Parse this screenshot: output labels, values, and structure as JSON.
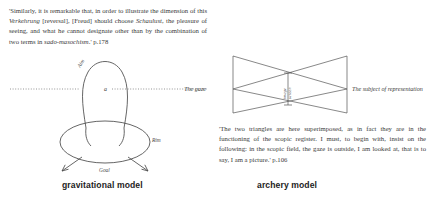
{
  "page": {
    "background_color": "#ffffff",
    "ink_color": "#4a4a4a",
    "text_color": "#3a3a3a"
  },
  "quotes": {
    "freud": "'Similarly, it is remarkable that, in order to illustrate the dimension of this Verkehrung [reversal], [Freud] should choose Schaulust, the pleasure of seeing, and what he cannot designate other than by the combination of two terms in sado-masochism.' p.178",
    "freud_page": "p.178",
    "scopic": "'The two triangles are here superimposed, as in fact they are in the functioning of the scopic register. I must, to begin with, insist on the following: in the scopic field, the gaze is outside, I am looked at, that is to say, I am a picture.' p.106",
    "scopic_page": "p.106"
  },
  "captions": {
    "left": "gravitational model",
    "right": "archery model"
  },
  "gravitational_model": {
    "labels": {
      "aim": "Aim",
      "rim": "Rim",
      "goal": "Goal",
      "object": "a"
    }
  },
  "archery_model": {
    "labels": {
      "left": "The gaze",
      "right": "The subject of representation",
      "center_left": "image",
      "center_right": "screen"
    }
  }
}
